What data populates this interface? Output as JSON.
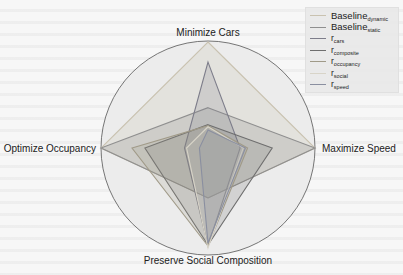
{
  "chart_data": {
    "type": "radar",
    "title": "",
    "axes": [
      "Minimize Cars",
      "Maximize Speed",
      "Preserve Social Composition",
      "Optimize Occupancy"
    ],
    "range": [
      0,
      1
    ],
    "grid": false,
    "legend_position": "upper right",
    "series": [
      {
        "name": "Baseline_dynamic",
        "label_main": "Baseline",
        "label_sub": "dynamic",
        "color": "#c9c2b0",
        "fill_opacity": 0.25,
        "values": [
          1.0,
          1.0,
          0.5,
          1.0
        ]
      },
      {
        "name": "Baseline_static",
        "label_main": "Baseline",
        "label_sub": "static",
        "color": "#8f8f8f",
        "fill_opacity": 0.25,
        "values": [
          0.38,
          1.0,
          0.5,
          1.0
        ]
      },
      {
        "name": "r_cars",
        "label_main": "r",
        "label_sub": "cars",
        "color": "#7d7d8a",
        "fill_opacity": 0.2,
        "values": [
          0.81,
          0.3,
          0.98,
          0.22
        ]
      },
      {
        "name": "r_composite",
        "label_main": "r",
        "label_sub": "composite",
        "color": "#6e6e6e",
        "fill_opacity": 0.2,
        "values": [
          0.22,
          0.6,
          0.97,
          0.59
        ]
      },
      {
        "name": "r_occupancy",
        "label_main": "r",
        "label_sub": "occupancy",
        "color": "#a09a88",
        "fill_opacity": 0.2,
        "values": [
          0.21,
          0.37,
          0.98,
          0.71
        ]
      },
      {
        "name": "r_social",
        "label_main": "r",
        "label_sub": "social",
        "color": "#d8d4c8",
        "fill_opacity": 0.15,
        "values": [
          0.2,
          0.33,
          1.0,
          0.2
        ]
      },
      {
        "name": "r_speed",
        "label_main": "r",
        "label_sub": "speed",
        "color": "#8a8fa0",
        "fill_opacity": 0.2,
        "values": [
          0.17,
          0.35,
          0.95,
          0.08
        ]
      }
    ]
  },
  "axis_labels": {
    "top": "Minimize Cars",
    "right": "Maximize Speed",
    "bottom": "Preserve Social Composition",
    "left": "Optimize Occupancy"
  }
}
